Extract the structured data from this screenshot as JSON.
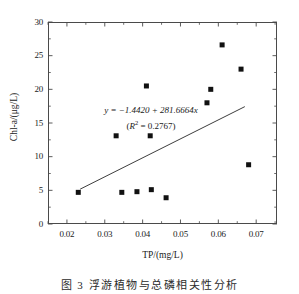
{
  "figure": {
    "caption": "图 3   浮游植物与总磷相关性分析"
  },
  "chart_data": {
    "type": "scatter",
    "title": "",
    "xlabel": "TP/(mg/L)",
    "ylabel": "Chl-a/(μg/L)",
    "xlim": [
      0.015,
      0.0755
    ],
    "ylim": [
      0,
      30
    ],
    "grid": false,
    "legend": null,
    "xticks": [
      0.02,
      0.03,
      0.04,
      0.05,
      0.06,
      0.07
    ],
    "xtick_labels": [
      "0.02",
      "0.03",
      "0.04",
      "0.05",
      "0.06",
      "0.07"
    ],
    "xminor_ticks": [
      0.015,
      0.025,
      0.035,
      0.045,
      0.055,
      0.065,
      0.075
    ],
    "yticks": [
      0,
      5,
      10,
      15,
      20,
      25,
      30
    ],
    "ytick_labels": [
      "0",
      "5",
      "10",
      "15",
      "20",
      "25",
      "30"
    ],
    "yminor_ticks": [
      2.5,
      7.5,
      12.5,
      17.5,
      22.5,
      27.5
    ],
    "marker": "square",
    "marker_color": "#111111",
    "marker_size": 5,
    "points": [
      {
        "x": 0.023,
        "y": 4.7
      },
      {
        "x": 0.033,
        "y": 13.1
      },
      {
        "x": 0.0345,
        "y": 4.7
      },
      {
        "x": 0.0385,
        "y": 4.8
      },
      {
        "x": 0.041,
        "y": 20.5
      },
      {
        "x": 0.042,
        "y": 13.1
      },
      {
        "x": 0.0423,
        "y": 5.1
      },
      {
        "x": 0.0462,
        "y": 3.9
      },
      {
        "x": 0.057,
        "y": 18.0
      },
      {
        "x": 0.058,
        "y": 20.0
      },
      {
        "x": 0.061,
        "y": 26.6
      },
      {
        "x": 0.066,
        "y": 23.0
      },
      {
        "x": 0.068,
        "y": 8.8
      }
    ],
    "fit_line": {
      "intercept": -1.442,
      "slope": 281.6664,
      "x_start": 0.0235,
      "x_end": 0.067,
      "color": "#333333",
      "equation_text": "y = −1.4420 + 281.6664x",
      "r_squared_text": "(R² = 0.2767)",
      "r_squared_value": 0.2767
    },
    "annotation": {
      "line1_lhs": "y",
      "line1_rhs": " = −1.4420 + 281.6664",
      "line1_var": "x",
      "line2_r": "R",
      "line2_sup": "2",
      "line2_rest": " = 0.2767)",
      "line2_open": "("
    }
  }
}
